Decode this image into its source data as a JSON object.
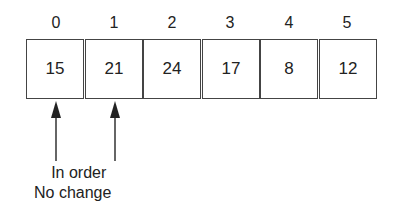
{
  "array": {
    "indices": [
      "0",
      "1",
      "2",
      "3",
      "4",
      "5"
    ],
    "values": [
      "15",
      "21",
      "24",
      "17",
      "8",
      "12"
    ]
  },
  "arrows": {
    "targets": [
      0,
      1
    ]
  },
  "caption": {
    "line1": "In order",
    "line2": "No change"
  }
}
